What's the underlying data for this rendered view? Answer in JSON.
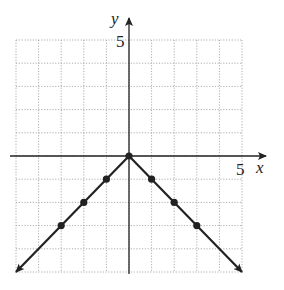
{
  "chart_data": {
    "type": "line",
    "title": "",
    "function": "y = -|x|",
    "xlabel": "x",
    "ylabel": "y",
    "xlim": [
      -5,
      5
    ],
    "ylim": [
      -5,
      5
    ],
    "grid": true,
    "tick_labels": {
      "x": "5",
      "y": "5"
    },
    "x": [
      -5,
      -3,
      -2,
      -1,
      0,
      1,
      2,
      3,
      5
    ],
    "y": [
      -5,
      -3,
      -2,
      -1,
      0,
      -1,
      -2,
      -3,
      -5
    ],
    "points": [
      [
        -3,
        -3
      ],
      [
        -2,
        -2
      ],
      [
        -1,
        -1
      ],
      [
        0,
        0
      ],
      [
        1,
        -1
      ],
      [
        2,
        -2
      ],
      [
        3,
        -3
      ]
    ],
    "arrows": "both ends"
  },
  "labels": {
    "x_axis": "x",
    "y_axis": "y",
    "x_tick": "5",
    "y_tick": "5"
  }
}
